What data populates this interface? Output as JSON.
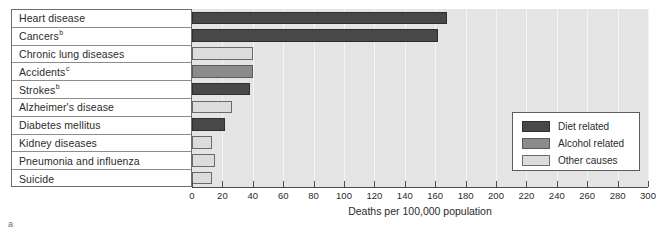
{
  "chart_data": {
    "type": "bar",
    "orientation": "horizontal",
    "title": "",
    "xlabel": "Deaths per 100,000 population",
    "ylabel": "",
    "xlim": [
      0,
      300
    ],
    "xticks": [
      0,
      20,
      40,
      60,
      80,
      100,
      120,
      140,
      160,
      180,
      200,
      220,
      240,
      260,
      280,
      300
    ],
    "grid": true,
    "legend_position": "right-middle",
    "categories": [
      "Heart disease",
      "Cancers",
      "Chronic lung diseases",
      "Accidents",
      "Strokes",
      "Alzheimer's disease",
      "Diabetes mellitus",
      "Kidney diseases",
      "Pneumonia and influenza",
      "Suicide"
    ],
    "values": [
      168,
      162,
      40,
      40,
      38,
      26,
      22,
      13,
      15,
      13
    ],
    "categories_display": [
      {
        "label": "Heart disease",
        "footnote": ""
      },
      {
        "label": "Cancers",
        "footnote": "b"
      },
      {
        "label": "Chronic lung diseases",
        "footnote": ""
      },
      {
        "label": "Accidents",
        "footnote": "c"
      },
      {
        "label": "Strokes",
        "footnote": "b"
      },
      {
        "label": "Alzheimer's disease",
        "footnote": ""
      },
      {
        "label": "Diabetes mellitus",
        "footnote": ""
      },
      {
        "label": "Kidney diseases",
        "footnote": ""
      },
      {
        "label": "Pneumonia and influenza",
        "footnote": ""
      },
      {
        "label": "Suicide",
        "footnote": ""
      }
    ],
    "bar_groups": [
      "diet",
      "diet",
      "other",
      "alcohol",
      "diet",
      "other",
      "diet",
      "other",
      "other",
      "other"
    ],
    "series": [
      {
        "name": "Diet related",
        "key": "diet",
        "color": "#484848"
      },
      {
        "name": "Alcohol related",
        "key": "alcohol",
        "color": "#8b8b8b"
      },
      {
        "name": "Other causes",
        "key": "other",
        "color": "#dcdcdc"
      }
    ]
  },
  "legend": {
    "items": [
      {
        "label": "Diet related",
        "key": "diet"
      },
      {
        "label": "Alcohol related",
        "key": "alcohol"
      },
      {
        "label": "Other causes",
        "key": "other"
      }
    ]
  },
  "axis": {
    "title": "Deaths per 100,000 population"
  },
  "footnote_marker": "a",
  "colors": {
    "diet": "#484848",
    "alcohol": "#8b8b8b",
    "other": "#dcdcdc",
    "plot_background": "#e4e4e4",
    "gridline": "#f4f4f4",
    "axis": "#4c4c4c"
  }
}
